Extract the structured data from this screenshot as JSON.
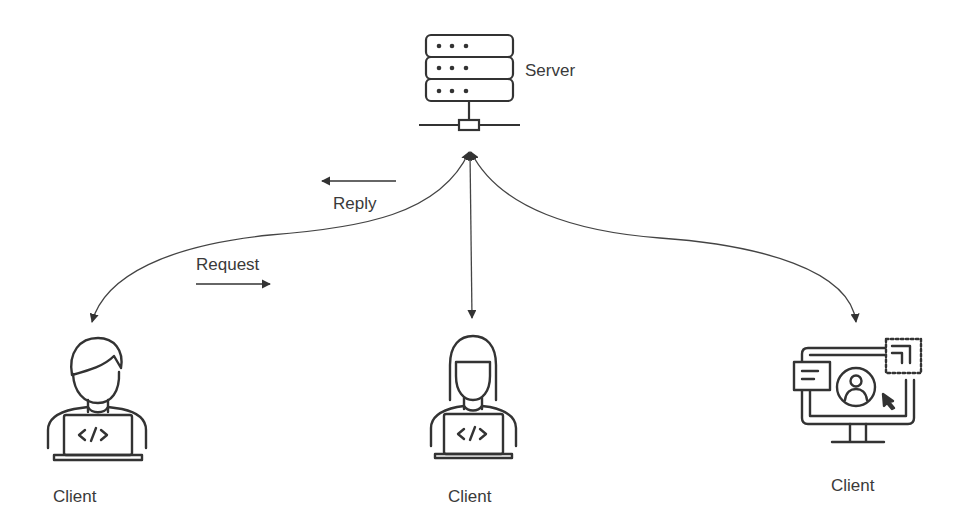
{
  "diagram": {
    "title": "",
    "type": "client-server",
    "colors": {
      "stroke": "#333333",
      "text": "#3a3a3a",
      "background": "#ffffff"
    },
    "nodes": [
      {
        "id": "server",
        "label": "Server",
        "icon": "server-rack-icon"
      },
      {
        "id": "client_1",
        "label": "Client",
        "icon": "developer-male-laptop-icon"
      },
      {
        "id": "client_2",
        "label": "Client",
        "icon": "developer-female-laptop-icon"
      },
      {
        "id": "client_3",
        "label": "Client",
        "icon": "monitor-user-interface-icon"
      }
    ],
    "edges": [
      {
        "from": "server",
        "to": "client_1",
        "style": "curved-bidirectional"
      },
      {
        "from": "server",
        "to": "client_2",
        "style": "straight-bidirectional"
      },
      {
        "from": "server",
        "to": "client_3",
        "style": "curved-bidirectional"
      }
    ],
    "annotations": {
      "reply": {
        "label": "Reply",
        "direction": "left (toward client)"
      },
      "request": {
        "label": "Request",
        "direction": "right (toward server)"
      }
    }
  }
}
